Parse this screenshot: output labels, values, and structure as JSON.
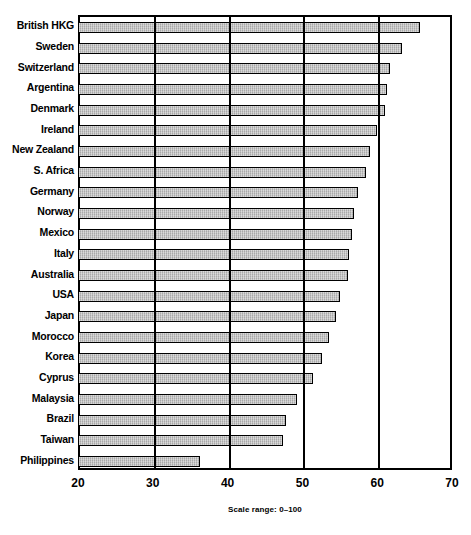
{
  "chart_data": {
    "type": "bar",
    "orientation": "horizontal",
    "title": "",
    "subtitle": "",
    "xlabel": "",
    "ylabel": "",
    "xlim": [
      20,
      70
    ],
    "xticks": [
      20,
      30,
      40,
      50,
      60,
      70
    ],
    "xtick_labels": [
      "20",
      "30",
      "40",
      "50",
      "60",
      "70"
    ],
    "grid": true,
    "grid_axis": "x",
    "legend": null,
    "annotation": "Scale range: 0–100",
    "bar_fill_color": "#b9b9b9",
    "bar_edge_color": "#000000",
    "categories": [
      "British HKG",
      "Sweden",
      "Switzerland",
      "Argentina",
      "Denmark",
      "Ireland",
      "New Zealand",
      "S. Africa",
      "Germany",
      "Norway",
      "Mexico",
      "Italy",
      "Australia",
      "USA",
      "Japan",
      "Morocco",
      "Korea",
      "Cyprus",
      "Malaysia",
      "Brazil",
      "Taiwan",
      "Philippines"
    ],
    "values": [
      65.5,
      63.0,
      61.5,
      61.0,
      60.8,
      59.7,
      58.8,
      58.2,
      57.2,
      56.6,
      56.3,
      56.0,
      55.8,
      54.8,
      54.2,
      53.3,
      52.4,
      51.2,
      49.0,
      47.6,
      47.2,
      36.0
    ]
  }
}
